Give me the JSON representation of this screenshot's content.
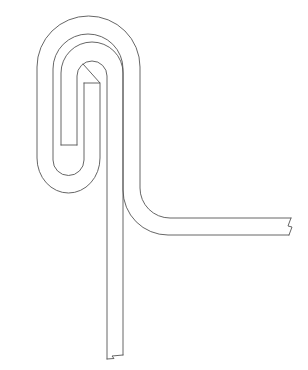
{
  "diagram": {
    "type": "line-drawing",
    "background": "#ffffff",
    "stroke_color": "#555555",
    "labels": [],
    "elements": [
      {
        "name": "outer-sheet",
        "description": "Outer wrapping sheet looping over the top and turning right into a horizontal flange"
      },
      {
        "name": "inner-sheet",
        "description": "Inner vertical sheet folded back into a hook inside the outer loop"
      },
      {
        "name": "bottom-break-mark",
        "description": "Zig-zag break line at bottom of vertical sheet"
      },
      {
        "name": "right-break-mark",
        "description": "Zig-zag break line at right end of horizontal flange"
      }
    ]
  }
}
